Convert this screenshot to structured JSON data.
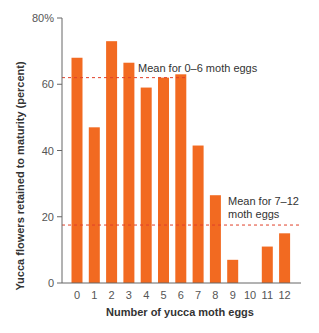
{
  "chart_data": {
    "type": "bar",
    "title": "",
    "xlabel": "Number of yucca moth eggs",
    "ylabel": "Yucca flowers retained to maturity (percent)",
    "categories": [
      "0",
      "1",
      "2",
      "3",
      "4",
      "5",
      "6",
      "7",
      "8",
      "9",
      "10",
      "11",
      "12"
    ],
    "values": [
      68,
      47,
      73,
      66.5,
      59,
      62,
      63,
      41.5,
      26.5,
      7,
      0,
      11,
      15
    ],
    "ylim": [
      0,
      80
    ],
    "yticks": [
      0,
      20,
      40,
      60,
      80
    ],
    "ytick_labels": [
      "0",
      "20",
      "40",
      "60",
      "80%"
    ],
    "grid": false,
    "legend": null,
    "annotations": [
      {
        "text": "Mean for 0–6 moth eggs",
        "type": "hline",
        "y": 62,
        "x_range": [
          "0",
          "6"
        ],
        "style": "dashed"
      },
      {
        "text": "Mean for 7–12 moth eggs",
        "lines": [
          "Mean for 7–12",
          "moth eggs"
        ],
        "type": "hline",
        "y": 17.5,
        "x_range": [
          "0",
          "12"
        ],
        "style": "dashed"
      }
    ],
    "colors": {
      "bar": "#F26A21",
      "mean_line": "#E0402A",
      "axis": "#666666"
    }
  }
}
